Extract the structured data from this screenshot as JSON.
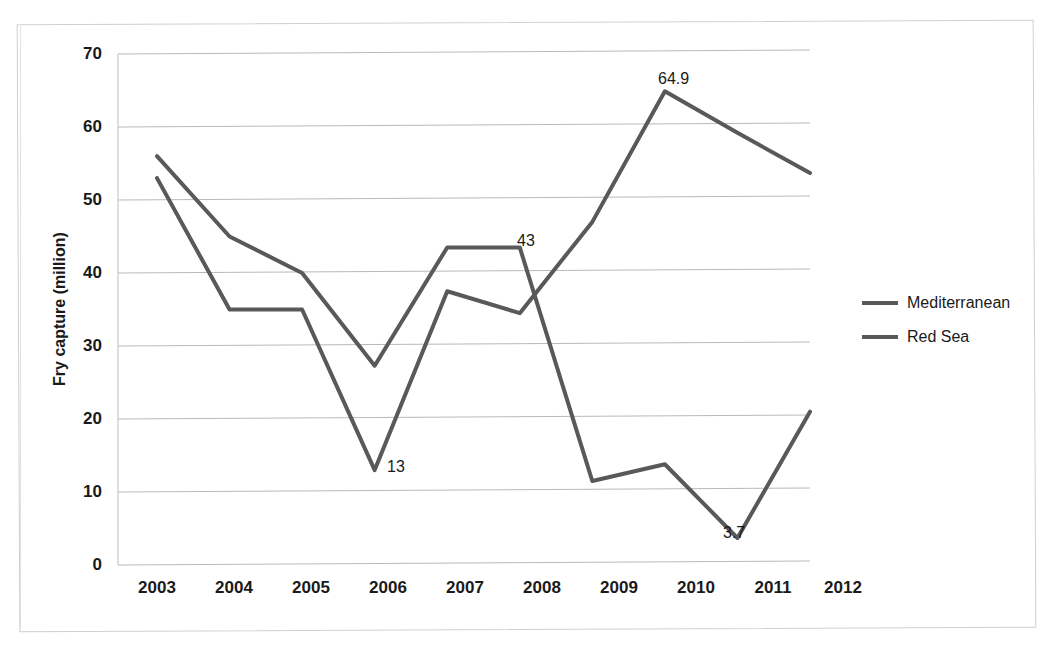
{
  "chart_data": {
    "type": "line",
    "title": "",
    "xlabel": "",
    "ylabel": "Fry capture (million)",
    "categories": [
      "2003",
      "2004",
      "2005",
      "2006",
      "2007",
      "2008",
      "2009",
      "2010",
      "2011",
      "2012"
    ],
    "ylim": [
      0,
      70
    ],
    "ytick_values": [
      0,
      10,
      20,
      30,
      40,
      50,
      60,
      70
    ],
    "ytick_labels": [
      "0",
      "10",
      "20",
      "30",
      "40",
      "50",
      "60",
      "70"
    ],
    "grid": true,
    "legend_position": "right",
    "series": [
      {
        "name": "Mediterranean",
        "color": "#595959",
        "values": [
          53.0,
          35.0,
          35.0,
          13.0,
          37.5,
          34.5,
          47.0,
          64.9,
          59.2,
          53.7
        ]
      },
      {
        "name": "Red Sea",
        "color": "#595959",
        "values": [
          56.0,
          45.0,
          40.0,
          27.3,
          43.5,
          43.5,
          11.5,
          13.8,
          3.7,
          21.0
        ]
      }
    ],
    "annotations": [
      {
        "text": "64.9",
        "series": "Mediterranean",
        "category": "2010",
        "value": 64.9
      },
      {
        "text": "43",
        "series": "Red Sea",
        "category": "2008",
        "value": 43.5
      },
      {
        "text": "13",
        "series": "Mediterranean",
        "category": "2006",
        "value": 13.0
      },
      {
        "text": "3.7",
        "series": "Mediterranean",
        "category": "2011",
        "value": 3.7
      }
    ]
  },
  "axis": {
    "y_title": "Fry capture (million)",
    "y_ticks": [
      "70",
      "60",
      "50",
      "40",
      "30",
      "20",
      "10",
      "0"
    ],
    "x_ticks": [
      "2003",
      "2004",
      "2005",
      "2006",
      "2007",
      "2008",
      "2009",
      "2010",
      "2011",
      "2012"
    ]
  },
  "legend": {
    "items": [
      {
        "label": "Mediterranean"
      },
      {
        "label": "Red Sea"
      }
    ]
  },
  "labels": {
    "peak": "64.9",
    "cross": "43",
    "dip2006": "13",
    "dip2011": "3.7"
  },
  "footnote": {
    "text": ""
  }
}
